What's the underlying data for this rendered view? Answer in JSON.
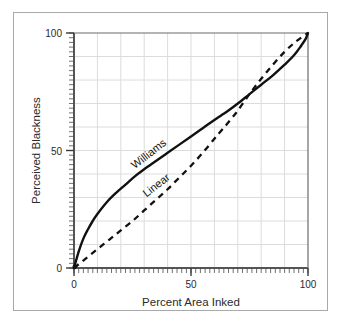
{
  "figure": {
    "background_color": "#ffffff",
    "frame_color": "#a9a9a9",
    "grid_color": "#dcdcdc",
    "axis_color": "#6b6b6b",
    "curve_color": "#111111"
  },
  "chart_data": {
    "type": "line",
    "title": "",
    "xlabel": "Percent Area Inked",
    "ylabel": "Perceived Blackness",
    "xlim": [
      0,
      100
    ],
    "ylim": [
      0,
      100
    ],
    "xticks": [
      0,
      50,
      100
    ],
    "yticks": [
      0,
      50,
      100
    ],
    "xtick_labels": [
      "0",
      "50",
      "100"
    ],
    "ytick_labels": [
      "0",
      "50",
      "100"
    ],
    "minor_tick_interval": 2,
    "grid": true,
    "grid_interval": 10,
    "legend": "inline-annotations",
    "series": [
      {
        "name": "Williams",
        "style": "solid",
        "color": "#111111",
        "label_x": 26,
        "label_y": 42,
        "label_rotation": -38,
        "x": [
          0,
          2,
          4,
          6,
          8,
          10,
          14,
          18,
          22,
          26,
          30,
          35,
          40,
          45,
          50,
          55,
          60,
          63,
          66,
          70,
          75,
          80,
          85,
          90,
          94,
          97,
          99,
          100
        ],
        "values": [
          0,
          7,
          12.5,
          16.5,
          20,
          23,
          28,
          32,
          35.5,
          39,
          42,
          45.5,
          49,
          52.5,
          56,
          59.5,
          63,
          65,
          67,
          70,
          74,
          78,
          82,
          86.5,
          90.5,
          94.5,
          97.5,
          100
        ]
      },
      {
        "name": "Linear",
        "style": "dashed",
        "color": "#111111",
        "label_x": 31,
        "label_y": 30,
        "label_rotation": -38,
        "x": [
          0,
          5,
          10,
          15,
          20,
          25,
          30,
          35,
          40,
          45,
          50,
          55,
          60,
          63,
          66,
          70,
          75,
          80,
          85,
          90,
          95,
          100
        ],
        "values": [
          0,
          4,
          8,
          12,
          16,
          20,
          24.5,
          29,
          33.5,
          38.5,
          43.5,
          49,
          55,
          58.5,
          62,
          67,
          74,
          80.5,
          86.5,
          92,
          96.5,
          100
        ]
      }
    ]
  }
}
